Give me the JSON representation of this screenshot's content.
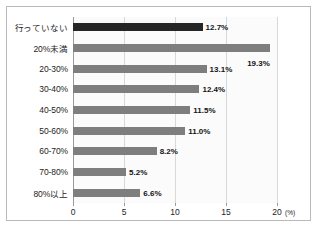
{
  "chart_data": {
    "type": "bar",
    "orientation": "horizontal",
    "title": "",
    "xlabel": "",
    "ylabel": "",
    "unit_label": "(%)",
    "xlim": [
      0,
      20
    ],
    "xticks": [
      0,
      5,
      10,
      15,
      20
    ],
    "xtick_labels": [
      "0",
      "5",
      "10",
      "15",
      "20"
    ],
    "grid": true,
    "legend": false,
    "categories": [
      "行っていない",
      "20%未満",
      "20-30%",
      "30-40%",
      "40-50%",
      "50-60%",
      "60-70%",
      "70-80%",
      "80%以上"
    ],
    "values": [
      12.7,
      19.3,
      13.1,
      12.4,
      11.5,
      11.0,
      8.2,
      5.2,
      6.6
    ],
    "value_labels": [
      "12.7%",
      "19.3%",
      "13.1%",
      "12.4%",
      "11.5%",
      "11.0%",
      "8.2%",
      "5.2%",
      "6.6%"
    ],
    "bar_colors": [
      "#262626",
      "#7e7e7e",
      "#7e7e7e",
      "#7e7e7e",
      "#7e7e7e",
      "#7e7e7e",
      "#7e7e7e",
      "#7e7e7e",
      "#7e7e7e"
    ],
    "label_placement": [
      "right",
      "below",
      "right",
      "right",
      "right",
      "right",
      "right",
      "right",
      "right"
    ]
  },
  "style": {
    "frame_color": "#b9b9b9",
    "grid_color": "#d8d8d8",
    "axis_color": "#9a9a9a",
    "text_color": "#1d1d1d",
    "plot_background": "#fbfbfb"
  }
}
